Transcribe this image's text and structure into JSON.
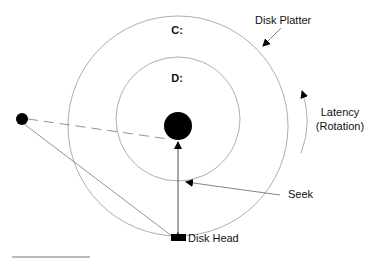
{
  "diagram": {
    "labels": {
      "outer_partition": "C:",
      "inner_partition": "D:",
      "platter": "Disk Platter",
      "latency_line1": "Latency",
      "latency_line2": "(Rotation)",
      "seek": "Seek",
      "head": "Disk Head"
    },
    "colors": {
      "stroke": "#888888",
      "fill": "#000000",
      "text": "#111111"
    }
  }
}
